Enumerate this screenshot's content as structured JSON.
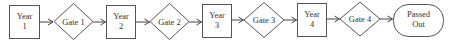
{
  "diagram": {
    "type": "flowchart",
    "direction": "left-to-right",
    "nodes": [
      {
        "id": "y1",
        "shape": "rect",
        "lines": [
          "Year",
          "1"
        ]
      },
      {
        "id": "g1",
        "shape": "diamond",
        "lines": [
          "Gate 1"
        ]
      },
      {
        "id": "y2",
        "shape": "rect",
        "lines": [
          "Year",
          "2"
        ]
      },
      {
        "id": "g2",
        "shape": "diamond",
        "lines": [
          "Gate 2"
        ]
      },
      {
        "id": "y3",
        "shape": "rect",
        "lines": [
          "Year",
          "3"
        ]
      },
      {
        "id": "g3",
        "shape": "diamond",
        "lines": [
          "Gate 3"
        ]
      },
      {
        "id": "y4",
        "shape": "rect",
        "lines": [
          "Year",
          "4"
        ]
      },
      {
        "id": "g4",
        "shape": "diamond",
        "lines": [
          "Gate 4"
        ]
      },
      {
        "id": "out",
        "shape": "terminal",
        "lines": [
          "Passed",
          "Out"
        ]
      }
    ],
    "edges": [
      {
        "from": "y1",
        "to": "g1"
      },
      {
        "from": "g1",
        "to": "y2"
      },
      {
        "from": "y2",
        "to": "g2"
      },
      {
        "from": "g2",
        "to": "y3"
      },
      {
        "from": "y3",
        "to": "g3"
      },
      {
        "from": "g3",
        "to": "y4"
      },
      {
        "from": "y4",
        "to": "g4"
      },
      {
        "from": "g4",
        "to": "out"
      }
    ]
  },
  "labels": {
    "y1": {
      "l1": "Year",
      "l2": "1"
    },
    "g1": {
      "l1": "Gate 1"
    },
    "y2": {
      "l1": "Year",
      "l2": "2"
    },
    "g2": {
      "l1": "Gate 2"
    },
    "y3": {
      "l1": "Year",
      "l2": "3"
    },
    "g3": {
      "l1": "Gate 3"
    },
    "y4": {
      "l1": "Year",
      "l2": "4"
    },
    "g4": {
      "l1": "Gate 4"
    },
    "out": {
      "l1": "Passed",
      "l2": "Out"
    }
  },
  "colors": {
    "stroke": "#555555",
    "text": "#333333",
    "background": "#ffffff"
  }
}
